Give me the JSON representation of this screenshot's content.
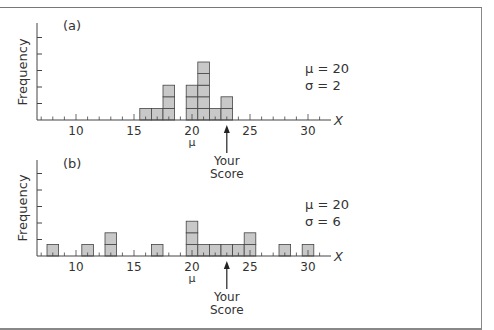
{
  "chart_data": [
    {
      "type": "bar",
      "panel_label": "(a)",
      "title": "",
      "xlabel": "X",
      "ylabel": "Frequency",
      "x_ticks": [
        10,
        15,
        20,
        25,
        30
      ],
      "xlim": [
        7,
        31
      ],
      "mean_marker": "μ",
      "mean_marker_x": 20,
      "categories": [
        16,
        17,
        18,
        20,
        21,
        22,
        23
      ],
      "values": [
        1,
        1,
        3,
        3,
        5,
        1,
        2
      ],
      "annotation": {
        "text_line1": "Your",
        "text_line2": "Score",
        "x": 23
      },
      "stats": {
        "mu": "μ = 20",
        "sigma": "σ = 2"
      }
    },
    {
      "type": "bar",
      "panel_label": "(b)",
      "title": "",
      "xlabel": "X",
      "ylabel": "Frequency",
      "x_ticks": [
        10,
        15,
        20,
        25,
        30
      ],
      "xlim": [
        7,
        31
      ],
      "mean_marker": "μ",
      "mean_marker_x": 20,
      "categories": [
        8,
        11,
        13,
        17,
        20,
        21,
        22,
        23,
        24,
        25,
        28,
        30
      ],
      "values": [
        1,
        1,
        2,
        1,
        3,
        1,
        1,
        1,
        1,
        2,
        1,
        1
      ],
      "annotation": {
        "text_line1": "Your",
        "text_line2": "Score",
        "x": 23
      },
      "stats": {
        "mu": "μ = 20",
        "sigma": "σ = 6"
      }
    }
  ],
  "colors": {
    "bar_fill": "#c8c8c8",
    "bar_stroke": "#444444",
    "axis": "#444444",
    "text": "#333333"
  }
}
